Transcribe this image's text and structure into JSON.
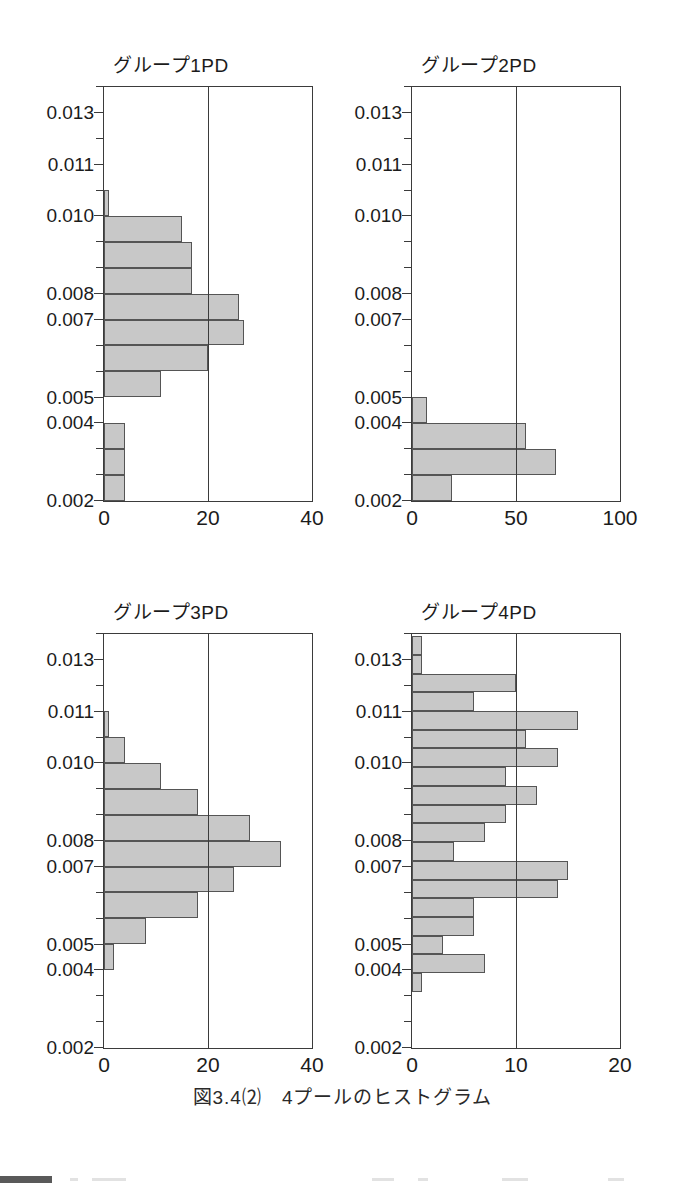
{
  "caption": "図3.4⑵　4プールのヒストグラム",
  "style": {
    "bar_fill": "#c8c8c8",
    "bar_stroke": "#555555",
    "axis_color": "#3b3b3b",
    "text_color": "#1b1b1b",
    "background": "#ffffff"
  },
  "panels": [
    {
      "id": "group1",
      "title": "グループ1PD"
    },
    {
      "id": "group2",
      "title": "グループ2PD"
    },
    {
      "id": "group3",
      "title": "グループ3PD"
    },
    {
      "id": "group4",
      "title": "グループ4PD"
    }
  ],
  "chart_data": [
    {
      "type": "bar",
      "orientation": "horizontal",
      "title": "グループ1PD",
      "xlabel": "",
      "ylabel": "",
      "xlim": [
        0,
        40
      ],
      "ylim": [
        0.002,
        0.0135
      ],
      "xticks": [
        0,
        20,
        40
      ],
      "xtick_labels": [
        "0",
        "20",
        "40"
      ],
      "yticks": [
        0.002,
        0.004,
        0.005,
        0.007,
        0.008,
        0.01,
        0.011,
        0.013
      ],
      "ytick_labels": [
        "0.002",
        "0.004",
        "0.005",
        "0.007",
        "0.008",
        "0.010",
        "0.011",
        "0.013"
      ],
      "grid": "vertical-midline-only",
      "legend": "none",
      "bin_count": 16,
      "bins_bottom_to_top": [
        {
          "y_lo": 0.002,
          "y_hi": 0.00272,
          "count": 4
        },
        {
          "y_lo": 0.00272,
          "y_hi": 0.00344,
          "count": 4
        },
        {
          "y_lo": 0.00344,
          "y_hi": 0.00416,
          "count": 4
        },
        {
          "y_lo": 0.00416,
          "y_hi": 0.00488,
          "count": 0
        },
        {
          "y_lo": 0.00488,
          "y_hi": 0.0056,
          "count": 11
        },
        {
          "y_lo": 0.0056,
          "y_hi": 0.00632,
          "count": 20
        },
        {
          "y_lo": 0.00632,
          "y_hi": 0.00704,
          "count": 27
        },
        {
          "y_lo": 0.00704,
          "y_hi": 0.00776,
          "count": 26
        },
        {
          "y_lo": 0.00776,
          "y_hi": 0.00848,
          "count": 17
        },
        {
          "y_lo": 0.00848,
          "y_hi": 0.0092,
          "count": 17
        },
        {
          "y_lo": 0.0092,
          "y_hi": 0.00992,
          "count": 15
        },
        {
          "y_lo": 0.00992,
          "y_hi": 0.01064,
          "count": 1
        },
        {
          "y_lo": 0.01064,
          "y_hi": 0.01136,
          "count": 0
        },
        {
          "y_lo": 0.01136,
          "y_hi": 0.01208,
          "count": 0
        },
        {
          "y_lo": 0.01208,
          "y_hi": 0.0128,
          "count": 0
        },
        {
          "y_lo": 0.0128,
          "y_hi": 0.01352,
          "count": 0
        }
      ]
    },
    {
      "type": "bar",
      "orientation": "horizontal",
      "title": "グループ2PD",
      "xlabel": "",
      "ylabel": "",
      "xlim": [
        0,
        100
      ],
      "ylim": [
        0.002,
        0.0135
      ],
      "xticks": [
        0,
        50,
        100
      ],
      "xtick_labels": [
        "0",
        "50",
        "100"
      ],
      "yticks": [
        0.002,
        0.004,
        0.005,
        0.007,
        0.008,
        0.01,
        0.011,
        0.013
      ],
      "ytick_labels": [
        "0.002",
        "0.004",
        "0.005",
        "0.007",
        "0.008",
        "0.010",
        "0.011",
        "0.013"
      ],
      "grid": "vertical-midline-only",
      "legend": "none",
      "bin_count": 16,
      "bins_bottom_to_top": [
        {
          "y_lo": 0.002,
          "y_hi": 0.00272,
          "count": 19
        },
        {
          "y_lo": 0.00272,
          "y_hi": 0.00344,
          "count": 69
        },
        {
          "y_lo": 0.00344,
          "y_hi": 0.00416,
          "count": 55
        },
        {
          "y_lo": 0.00416,
          "y_hi": 0.00488,
          "count": 7
        },
        {
          "y_lo": 0.00488,
          "y_hi": 0.0056,
          "count": 0
        },
        {
          "y_lo": 0.0056,
          "y_hi": 0.00632,
          "count": 0
        },
        {
          "y_lo": 0.00632,
          "y_hi": 0.00704,
          "count": 0
        },
        {
          "y_lo": 0.00704,
          "y_hi": 0.00776,
          "count": 0
        },
        {
          "y_lo": 0.00776,
          "y_hi": 0.00848,
          "count": 0
        },
        {
          "y_lo": 0.00848,
          "y_hi": 0.0092,
          "count": 0
        },
        {
          "y_lo": 0.0092,
          "y_hi": 0.00992,
          "count": 0
        },
        {
          "y_lo": 0.00992,
          "y_hi": 0.01064,
          "count": 0
        },
        {
          "y_lo": 0.01064,
          "y_hi": 0.01136,
          "count": 0
        },
        {
          "y_lo": 0.01136,
          "y_hi": 0.01208,
          "count": 0
        },
        {
          "y_lo": 0.01208,
          "y_hi": 0.0128,
          "count": 0
        },
        {
          "y_lo": 0.0128,
          "y_hi": 0.01352,
          "count": 0
        }
      ]
    },
    {
      "type": "bar",
      "orientation": "horizontal",
      "title": "グループ3PD",
      "xlabel": "",
      "ylabel": "",
      "xlim": [
        0,
        40
      ],
      "ylim": [
        0.002,
        0.0135
      ],
      "xticks": [
        0,
        20,
        40
      ],
      "xtick_labels": [
        "0",
        "20",
        "40"
      ],
      "yticks": [
        0.002,
        0.004,
        0.005,
        0.007,
        0.008,
        0.01,
        0.011,
        0.013
      ],
      "ytick_labels": [
        "0.002",
        "0.004",
        "0.005",
        "0.007",
        "0.008",
        "0.010",
        "0.011",
        "0.013"
      ],
      "grid": "vertical-midline-only",
      "legend": "none",
      "bin_count": 16,
      "bins_bottom_to_top": [
        {
          "y_lo": 0.002,
          "y_hi": 0.00272,
          "count": 0
        },
        {
          "y_lo": 0.00272,
          "y_hi": 0.00344,
          "count": 0
        },
        {
          "y_lo": 0.00344,
          "y_hi": 0.00416,
          "count": 0
        },
        {
          "y_lo": 0.00416,
          "y_hi": 0.00488,
          "count": 2
        },
        {
          "y_lo": 0.00488,
          "y_hi": 0.0056,
          "count": 8
        },
        {
          "y_lo": 0.0056,
          "y_hi": 0.00632,
          "count": 18
        },
        {
          "y_lo": 0.00632,
          "y_hi": 0.00704,
          "count": 25
        },
        {
          "y_lo": 0.00704,
          "y_hi": 0.00776,
          "count": 34
        },
        {
          "y_lo": 0.00776,
          "y_hi": 0.00848,
          "count": 28
        },
        {
          "y_lo": 0.00848,
          "y_hi": 0.0092,
          "count": 18
        },
        {
          "y_lo": 0.0092,
          "y_hi": 0.00992,
          "count": 11
        },
        {
          "y_lo": 0.00992,
          "y_hi": 0.01064,
          "count": 4
        },
        {
          "y_lo": 0.01064,
          "y_hi": 0.01136,
          "count": 1
        },
        {
          "y_lo": 0.01136,
          "y_hi": 0.01208,
          "count": 0
        },
        {
          "y_lo": 0.01208,
          "y_hi": 0.0128,
          "count": 0
        },
        {
          "y_lo": 0.0128,
          "y_hi": 0.01352,
          "count": 0
        }
      ]
    },
    {
      "type": "bar",
      "orientation": "horizontal",
      "title": "グループ4PD",
      "xlabel": "",
      "ylabel": "",
      "xlim": [
        0,
        20
      ],
      "ylim": [
        0.002,
        0.0135
      ],
      "xticks": [
        0,
        10,
        20
      ],
      "xtick_labels": [
        "0",
        "10",
        "20"
      ],
      "yticks": [
        0.002,
        0.004,
        0.005,
        0.007,
        0.008,
        0.01,
        0.011,
        0.013
      ],
      "ytick_labels": [
        "0.002",
        "0.004",
        "0.005",
        "0.007",
        "0.008",
        "0.010",
        "0.011",
        "0.013"
      ],
      "grid": "vertical-midline-only",
      "legend": "none",
      "bin_count": 22,
      "bins_bottom_to_top": [
        {
          "y_lo": 0.002,
          "y_hi": 0.00252,
          "count": 0
        },
        {
          "y_lo": 0.00252,
          "y_hi": 0.00304,
          "count": 0
        },
        {
          "y_lo": 0.00304,
          "y_hi": 0.00356,
          "count": 0
        },
        {
          "y_lo": 0.00356,
          "y_hi": 0.00408,
          "count": 1
        },
        {
          "y_lo": 0.00408,
          "y_hi": 0.0046,
          "count": 7
        },
        {
          "y_lo": 0.0046,
          "y_hi": 0.00512,
          "count": 3
        },
        {
          "y_lo": 0.00512,
          "y_hi": 0.00564,
          "count": 6
        },
        {
          "y_lo": 0.00564,
          "y_hi": 0.00616,
          "count": 6
        },
        {
          "y_lo": 0.00616,
          "y_hi": 0.00668,
          "count": 14
        },
        {
          "y_lo": 0.00668,
          "y_hi": 0.0072,
          "count": 15
        },
        {
          "y_lo": 0.0072,
          "y_hi": 0.00772,
          "count": 4
        },
        {
          "y_lo": 0.00772,
          "y_hi": 0.00824,
          "count": 7
        },
        {
          "y_lo": 0.00824,
          "y_hi": 0.00876,
          "count": 9
        },
        {
          "y_lo": 0.00876,
          "y_hi": 0.00928,
          "count": 12
        },
        {
          "y_lo": 0.00928,
          "y_hi": 0.0098,
          "count": 9
        },
        {
          "y_lo": 0.0098,
          "y_hi": 0.01032,
          "count": 14
        },
        {
          "y_lo": 0.01032,
          "y_hi": 0.01084,
          "count": 11
        },
        {
          "y_lo": 0.01084,
          "y_hi": 0.01136,
          "count": 16
        },
        {
          "y_lo": 0.01136,
          "y_hi": 0.01188,
          "count": 6
        },
        {
          "y_lo": 0.01188,
          "y_hi": 0.0124,
          "count": 10
        },
        {
          "y_lo": 0.0124,
          "y_hi": 0.01292,
          "count": 1
        },
        {
          "y_lo": 0.01292,
          "y_hi": 0.01344,
          "count": 1
        }
      ]
    }
  ]
}
